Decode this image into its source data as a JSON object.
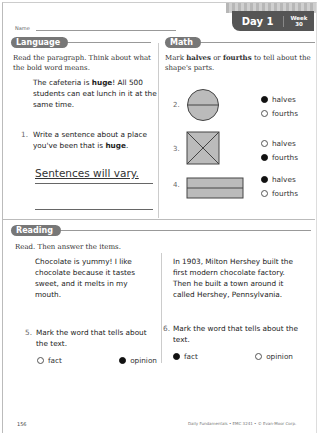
{
  "header": {
    "name_label": "Name",
    "day_label": "Day 1",
    "week_label": "Week",
    "week_number": "30"
  },
  "language": {
    "section_title": "Language",
    "instructions": "Read the paragraph. Think about what the bold word means.",
    "passage_before": "The cafeteria is ",
    "passage_bold": "huge",
    "passage_after": "! All 500 students can eat lunch in it at the same time.",
    "q1_number": "1.",
    "q1_text": "Write a sentence about a place you've been that is",
    "q1_bold": "huge",
    "q1_end": ".",
    "answer": "Sentences will vary."
  },
  "math": {
    "section_title": "Math",
    "instructions_a": "Mark ",
    "instructions_b1": "halves",
    "instructions_c": " or ",
    "instructions_b2": "fourths",
    "instructions_d": " to tell about the shape's parts.",
    "items": [
      {
        "number": "2.",
        "shape": "circle-halves",
        "options": [
          {
            "label": "halves",
            "selected": true
          },
          {
            "label": "fourths",
            "selected": false
          }
        ]
      },
      {
        "number": "3.",
        "shape": "square-fourths",
        "options": [
          {
            "label": "halves",
            "selected": false
          },
          {
            "label": "fourths",
            "selected": true
          }
        ]
      },
      {
        "number": "4.",
        "shape": "rectangle-halves",
        "options": [
          {
            "label": "halves",
            "selected": true
          },
          {
            "label": "fourths",
            "selected": false
          }
        ]
      }
    ]
  },
  "reading": {
    "section_title": "Reading",
    "instructions": "Read. Then answer the items.",
    "passage_left": "Chocolate is yummy! I like chocolate because it tastes sweet, and it melts in my mouth.",
    "passage_right": "In 1903, Milton Hershey built the first modern chocolate factory. Then he built a town around it called Hershey, Pennsylvania.",
    "q5_number": "5.",
    "q5_text": "Mark the word that tells about the text.",
    "q5_options": [
      {
        "label": "fact",
        "selected": false
      },
      {
        "label": "opinion",
        "selected": true
      }
    ],
    "q6_number": "6.",
    "q6_text": "Mark the word that tells about the text.",
    "q6_options": [
      {
        "label": "fact",
        "selected": true
      },
      {
        "label": "opinion",
        "selected": false
      }
    ]
  },
  "footer": {
    "page_number": "156",
    "credit": "Daily Fundamentals • EMC 3241 • © Evan-Moor Corp."
  }
}
